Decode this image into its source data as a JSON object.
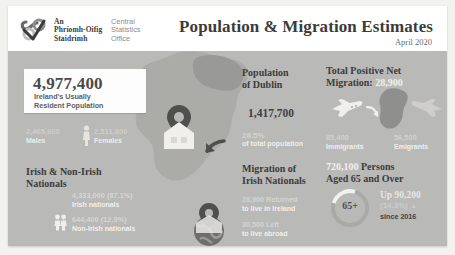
{
  "header": {
    "logo_icon": "cso-logo-icon",
    "org_irish": "An\nPhríomh-Oifig\nStaidrimh",
    "org_irish_line1": "An",
    "org_irish_line2": "Phríomh-Oifig",
    "org_irish_line3": "Staidrimh",
    "org_english_line1": "Central",
    "org_english_line2": "Statistics",
    "org_english_line3": "Office",
    "title": "Population & Migration Estimates",
    "subtitle": "April 2020"
  },
  "population": {
    "value": "4,977,400",
    "caption_line1": "Ireland's Usually",
    "caption_line2": "Resident Population",
    "males_value": "2,465,600",
    "males_label": "Males",
    "females_value": "2,511,800",
    "females_label": "Females",
    "gender_icon": "male-female-icon"
  },
  "nationals": {
    "title_line1": "Irish & Non-Irish",
    "title_line2": "Nationals",
    "people_icon": "two-people-icon",
    "rows": [
      {
        "value": "4,333,000 (87.1%)",
        "label": "Irish nationals"
      },
      {
        "value": "644,400 (12.9%)",
        "label": "Non-Irish nationals"
      }
    ]
  },
  "dublin": {
    "title_line1": "Population",
    "title_line2": "of Dublin",
    "value": "1,417,700",
    "percent": "28.5%",
    "percent_label": "of total population",
    "map_icon": "ireland-map-icon",
    "home_pin_icon": "home-location-pin-icon"
  },
  "migration_irish": {
    "title_line1": "Migration of",
    "title_line2": "Irish Nationals",
    "globe_icon": "globe-location-pin-icon",
    "rows": [
      {
        "value": "28,900 Returned",
        "label": "to live in Ireland"
      },
      {
        "value": "30,500 Left",
        "label": "to live abroad"
      }
    ]
  },
  "net_migration": {
    "title_prefix": "Total Positive Net",
    "title_line2_label": "Migration:",
    "title_value": "28,900",
    "plane_in_icon": "airplane-arriving-icon",
    "plane_out_icon": "airplane-departing-icon",
    "arrow_icon": "curved-arrow-icon",
    "immigrants_value": "85,400",
    "immigrants_label": "Immigrants",
    "emigrants_value": "56,500",
    "emigrants_label": "Emigrants"
  },
  "aged": {
    "title_value": "720,100",
    "title_rest": "Persons",
    "title_line2": "Aged 65 and Over",
    "ring_label": "65+",
    "up_value": "Up 90,200",
    "up_percent": "(14.3%)",
    "up_arrow_icon": "arrow-up-icon",
    "since": "since 2016"
  },
  "colors": {
    "canvas": "#b9b9b7",
    "panel": "#ffffff",
    "text_dark": "#3c3c3c",
    "text_light": "#f0efec"
  }
}
